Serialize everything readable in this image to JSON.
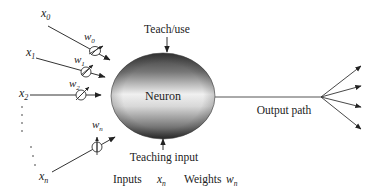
{
  "diagram": {
    "type": "neuron-model",
    "neuron_label": "Neuron",
    "teach_use_label": "Teach/use",
    "teaching_input_label": "Teaching input",
    "output_path_label": "Output path",
    "legend": {
      "inputs_label": "Inputs",
      "inputs_symbol": "x",
      "inputs_subscript": "n",
      "weights_label": "Weights",
      "weights_symbol": "w",
      "weights_subscript": "n"
    },
    "inputs": [
      {
        "name": "x",
        "sub": "0",
        "weight": "w",
        "weight_sub": "0"
      },
      {
        "name": "x",
        "sub": "1",
        "weight": "w",
        "weight_sub": "1"
      },
      {
        "name": "x",
        "sub": "2",
        "weight": "w",
        "weight_sub": "2"
      },
      {
        "name": "x",
        "sub": "n",
        "weight": "w",
        "weight_sub": "n"
      }
    ],
    "output_branches": 4,
    "colors": {
      "line": "#333333",
      "neuron_dark": "#3a3a3a",
      "neuron_light": "#f2f2f2"
    }
  }
}
